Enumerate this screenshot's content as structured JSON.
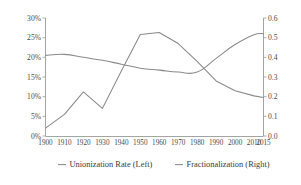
{
  "chart_data": {
    "type": "line",
    "title": "",
    "xlabel": "",
    "ylabel": "",
    "grid": false,
    "legend_position": "bottom",
    "x": [
      1900,
      1910,
      1920,
      1930,
      1940,
      1950,
      1960,
      1970,
      1980,
      1990,
      2000,
      2010,
      2015
    ],
    "x_tick_labels": [
      "1900",
      "1910",
      "1920",
      "1930",
      "1940",
      "1950",
      "1960",
      "1970",
      "1980",
      "1990",
      "2000",
      "2010",
      "2015"
    ],
    "xlim": [
      1900,
      2015
    ],
    "axes": [
      {
        "id": "left",
        "side": "left",
        "ylim": [
          0,
          30
        ],
        "ticks": [
          0,
          5,
          10,
          15,
          20,
          25,
          30
        ],
        "tick_labels": [
          "0%",
          "5%",
          "10%",
          "15%",
          "20%",
          "25%",
          "30%"
        ]
      },
      {
        "id": "right",
        "side": "right",
        "ylim": [
          0.0,
          0.6
        ],
        "ticks": [
          0.0,
          0.1,
          0.2,
          0.3,
          0.4,
          0.5,
          0.6
        ],
        "tick_labels": [
          "0.0",
          "0.1",
          "0.2",
          "0.3",
          "0.4",
          "0.5",
          "0.6"
        ]
      }
    ],
    "series": [
      {
        "name": "Unionization Rate (Left)",
        "axis": "left",
        "color": "#8a8a8a",
        "values": [
          2.0,
          5.5,
          11.2,
          7.0,
          16.5,
          25.8,
          26.3,
          23.5,
          19.0,
          14.0,
          11.5,
          10.2,
          9.8
        ]
      },
      {
        "name": "Fractionalization (Right)",
        "axis": "right",
        "color": "#8a8a8a",
        "values": [
          0.41,
          0.415,
          0.4,
          0.385,
          0.365,
          0.345,
          0.335,
          0.325,
          0.325,
          0.395,
          0.465,
          0.515,
          0.52
        ]
      }
    ]
  },
  "legend": {
    "items": [
      {
        "label": "Unionization Rate (Left)",
        "color": "#8a8a8a"
      },
      {
        "label": "Fractionalization (Right)",
        "color": "#8a8a8a"
      }
    ]
  }
}
